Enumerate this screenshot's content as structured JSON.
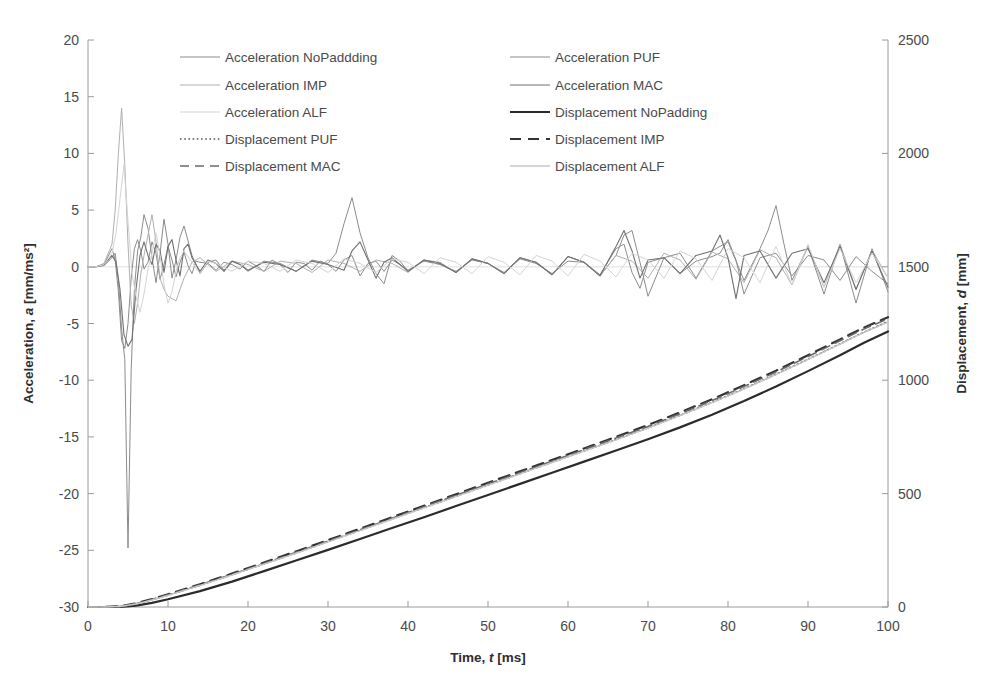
{
  "chart_data": {
    "type": "line",
    "title": "",
    "xlabel_parts": {
      "pre": "Time, ",
      "sym": "t",
      "post": " [ms]"
    },
    "ylabel_left_parts": {
      "pre": "Acceleration, ",
      "sym": "a",
      "post": " [mm/ms²]"
    },
    "ylabel_right_parts": {
      "pre": "Displacement, ",
      "sym": "d",
      "post": " [mm]"
    },
    "xlabel": "Time, t [ms]",
    "ylabel": "Acceleration, a [mm/ms²]",
    "ylabel_right": "Displacement, d [mm]",
    "xlim": [
      0,
      100
    ],
    "ylim": [
      -30,
      20
    ],
    "ylim_right": [
      0,
      2500
    ],
    "xticks": [
      0,
      10,
      20,
      30,
      40,
      50,
      60,
      70,
      80,
      90,
      100
    ],
    "yticks_left": [
      20,
      15,
      10,
      5,
      0,
      -5,
      -10,
      -15,
      -20,
      -25,
      -30
    ],
    "yticks_right": [
      2500,
      2000,
      1500,
      1000,
      500,
      0
    ],
    "grid": false,
    "legend_position": "top-inside",
    "legend_columns": 2,
    "series": [
      {
        "name": "Acceleration NoPaddding",
        "axis": "left",
        "color": "#8c8c8c",
        "width": 1.0,
        "dash": "none",
        "legend_col": 0,
        "legend_row": 0,
        "x": [
          0,
          1,
          2,
          3,
          3.4,
          3.8,
          4.2,
          4.6,
          5,
          5.4,
          5.8,
          6.2,
          6.6,
          7,
          7.5,
          8,
          8.5,
          9,
          9.5,
          10,
          10.5,
          11,
          11.5,
          12,
          12.5,
          13,
          13.5,
          14,
          15,
          16,
          17,
          18,
          19,
          20,
          21,
          22,
          23,
          24,
          25,
          26,
          27,
          28,
          29,
          30,
          31,
          32,
          33,
          34,
          35,
          36,
          37,
          38,
          39,
          40,
          42,
          44,
          46,
          48,
          50,
          52,
          54,
          56,
          58,
          60,
          62,
          64,
          66,
          67,
          68,
          69,
          70,
          72,
          74,
          76,
          78,
          79,
          80,
          81,
          82,
          84,
          86,
          88,
          90,
          92,
          94,
          96,
          98,
          100
        ],
        "y": [
          0,
          0,
          0.2,
          1.6,
          0.6,
          -2.2,
          -6.5,
          -7.2,
          -5.0,
          -1.0,
          1.6,
          2.4,
          1.4,
          -0.2,
          0.4,
          2.2,
          1.2,
          -1.1,
          0.2,
          1.8,
          0.6,
          -0.9,
          0.4,
          1.3,
          0.1,
          -0.6,
          0.5,
          0.4,
          0.3,
          -0.3,
          0.4,
          0.2,
          -0.2,
          0.5,
          0.1,
          -0.4,
          0.6,
          0.2,
          -0.5,
          0.4,
          0.3,
          -0.3,
          0.5,
          0.2,
          -0.4,
          0.6,
          1.0,
          -0.8,
          0.3,
          0.5,
          -0.4,
          0.6,
          0.2,
          -0.3,
          0.5,
          0.2,
          -0.4,
          0.6,
          0.3,
          -0.5,
          0.7,
          0.3,
          -0.6,
          0.5,
          0.4,
          -0.7,
          1.6,
          2.0,
          -0.5,
          -1.9,
          0.4,
          0.8,
          -0.6,
          0.5,
          0.9,
          1.2,
          2.4,
          0.6,
          -2.4,
          0.8,
          1.2,
          -0.8,
          1.0,
          0.6,
          -1.2,
          0.9,
          -0.4,
          -1.5
        ]
      },
      {
        "name": "Acceleration PUF",
        "axis": "left",
        "color": "#8c8c8c",
        "width": 1.0,
        "dash": "none",
        "legend_col": 1,
        "legend_row": 0,
        "x": [
          0,
          1,
          2,
          3,
          3.4,
          3.8,
          4.2,
          4.6,
          5,
          5.4,
          5.8,
          6.2,
          6.6,
          7,
          7.5,
          8,
          8.5,
          9,
          9.5,
          10,
          10.5,
          11,
          11.5,
          12,
          13,
          14,
          15,
          16,
          17,
          18,
          19,
          20,
          22,
          24,
          26,
          28,
          30,
          31,
          32,
          33,
          34,
          35,
          36,
          37,
          38,
          39,
          40,
          42,
          44,
          46,
          48,
          50,
          52,
          54,
          56,
          58,
          60,
          62,
          64,
          66,
          67,
          68,
          69,
          70,
          72,
          74,
          76,
          78,
          80,
          82,
          84,
          85,
          86,
          87,
          88,
          90,
          92,
          94,
          96,
          98,
          100
        ],
        "y": [
          0,
          0,
          0.1,
          0.8,
          1.2,
          -1.2,
          -5.5,
          -8.2,
          -24.8,
          -9.0,
          -2.0,
          1.4,
          2.6,
          4.6,
          3.4,
          0.8,
          -1.4,
          1.2,
          4.2,
          2.0,
          -1.0,
          0.6,
          2.6,
          3.6,
          1.0,
          -0.6,
          0.4,
          0.6,
          -0.3,
          0.5,
          0.2,
          -0.4,
          0.5,
          0.3,
          -0.4,
          0.6,
          0.3,
          1.2,
          3.8,
          6.1,
          3.0,
          0.8,
          -0.6,
          -1.5,
          1.0,
          0.5,
          -0.4,
          0.6,
          0.3,
          -0.5,
          0.7,
          0.3,
          -0.6,
          0.8,
          0.4,
          -0.7,
          0.9,
          0.4,
          -0.8,
          1.0,
          2.8,
          3.2,
          0.4,
          -2.6,
          0.8,
          1.2,
          -1.0,
          1.4,
          2.2,
          -1.2,
          1.6,
          3.2,
          5.4,
          2.0,
          -1.2,
          1.8,
          -2.4,
          2.0,
          -3.2,
          1.6,
          -2.2
        ]
      },
      {
        "name": "Acceleration IMP",
        "axis": "left",
        "color": "#b0b0b0",
        "width": 1.0,
        "dash": "none",
        "legend_col": 0,
        "legend_row": 1,
        "x": [
          0,
          1,
          2,
          3,
          3.4,
          3.8,
          4.2,
          4.6,
          5,
          5.4,
          5.8,
          6.2,
          6.6,
          7,
          7.5,
          8,
          8.5,
          9,
          9.5,
          10,
          11,
          12,
          13,
          14,
          15,
          16,
          18,
          20,
          22,
          24,
          26,
          28,
          30,
          32,
          34,
          36,
          38,
          40,
          42,
          44,
          46,
          48,
          50,
          52,
          54,
          56,
          58,
          60,
          62,
          64,
          66,
          68,
          70,
          72,
          74,
          76,
          78,
          80,
          82,
          84,
          86,
          88,
          90,
          92,
          94,
          96,
          98,
          100
        ],
        "y": [
          0,
          0,
          0.3,
          2.0,
          5.0,
          10.0,
          14.0,
          9.0,
          2.0,
          -3.4,
          -5.0,
          -3.2,
          -0.6,
          1.0,
          2.8,
          4.6,
          2.2,
          -1.0,
          -2.0,
          -2.6,
          -3.0,
          -1.0,
          0.4,
          0.8,
          0.2,
          -0.4,
          0.5,
          0.2,
          -0.4,
          0.5,
          0.3,
          -0.5,
          0.6,
          0.3,
          -0.4,
          0.6,
          0.3,
          -0.5,
          0.6,
          0.4,
          -0.5,
          0.7,
          0.3,
          -0.6,
          0.8,
          0.4,
          -0.7,
          0.9,
          0.4,
          -0.8,
          1.0,
          0.5,
          -1.0,
          1.2,
          0.6,
          -1.1,
          1.3,
          0.7,
          -1.4,
          1.5,
          0.8,
          -1.6,
          1.8,
          -1.8,
          2.0,
          -2.0,
          1.5,
          -1.0
        ]
      },
      {
        "name": "Acceleration MAC",
        "axis": "left",
        "color": "#707070",
        "width": 1.1,
        "dash": "none",
        "legend_col": 1,
        "legend_row": 1,
        "x": [
          0,
          1,
          2,
          3,
          3.5,
          4,
          4.5,
          5,
          5.5,
          6,
          6.5,
          7,
          7.5,
          8,
          8.5,
          9,
          9.5,
          10,
          10.5,
          11,
          11.5,
          12,
          12.5,
          13,
          14,
          15,
          16,
          17,
          18,
          19,
          20,
          22,
          24,
          26,
          28,
          30,
          32,
          33,
          34,
          35,
          36,
          37,
          38,
          40,
          42,
          44,
          46,
          48,
          50,
          52,
          54,
          56,
          58,
          60,
          62,
          64,
          66,
          67,
          68,
          69,
          70,
          72,
          74,
          76,
          78,
          79,
          80,
          81,
          82,
          84,
          86,
          88,
          90,
          92,
          94,
          96,
          98,
          100
        ],
        "y": [
          0,
          0,
          0.2,
          1.0,
          0.4,
          -2.0,
          -6.0,
          -7.0,
          -6.4,
          -2.0,
          1.0,
          2.2,
          1.0,
          0.2,
          2.0,
          1.4,
          -0.5,
          1.8,
          2.4,
          0.6,
          -0.8,
          1.6,
          2.0,
          0.8,
          -0.4,
          0.6,
          0.3,
          -0.4,
          0.5,
          0.2,
          -0.3,
          0.4,
          0.2,
          -0.4,
          0.5,
          0.2,
          -0.3,
          1.4,
          2.2,
          0.6,
          -1.0,
          0.4,
          0.8,
          -0.4,
          0.6,
          0.3,
          -0.5,
          0.7,
          0.3,
          -0.6,
          0.8,
          0.4,
          -0.7,
          0.9,
          0.4,
          -0.8,
          1.8,
          3.2,
          1.4,
          -1.0,
          0.6,
          0.8,
          -0.6,
          1.0,
          1.4,
          2.8,
          0.8,
          -2.8,
          1.0,
          1.4,
          -1.0,
          1.2,
          1.6,
          -1.4,
          1.8,
          -2.0,
          1.4,
          -1.8
        ]
      },
      {
        "name": "Acceleration ALF",
        "axis": "left",
        "color": "#d4d4d4",
        "width": 1.0,
        "dash": "none",
        "legend_col": 0,
        "legend_row": 2,
        "x": [
          0,
          1,
          2,
          3,
          3.5,
          4,
          4.5,
          5,
          5.5,
          6,
          6.5,
          7,
          7.5,
          8,
          8.5,
          9,
          9.5,
          10,
          10.5,
          11,
          11.5,
          12,
          13,
          14,
          15,
          16,
          18,
          20,
          22,
          24,
          26,
          28,
          30,
          32,
          34,
          36,
          38,
          40,
          42,
          44,
          46,
          48,
          50,
          52,
          54,
          56,
          58,
          60,
          62,
          64,
          66,
          68,
          70,
          72,
          74,
          76,
          78,
          80,
          82,
          84,
          86,
          88,
          90,
          92,
          94,
          96,
          98,
          100
        ],
        "y": [
          0,
          0,
          0.2,
          1.2,
          3.0,
          6.0,
          9.0,
          4.0,
          -0.6,
          -2.6,
          -4.0,
          -2.4,
          -0.2,
          1.2,
          3.0,
          1.0,
          -1.6,
          -3.2,
          -2.2,
          -0.4,
          0.8,
          1.4,
          0.4,
          -0.6,
          0.5,
          0.3,
          -0.4,
          0.5,
          0.3,
          -0.4,
          0.6,
          0.3,
          -0.5,
          0.7,
          0.3,
          -0.5,
          0.7,
          0.4,
          -0.6,
          0.8,
          0.4,
          -0.6,
          0.9,
          0.4,
          -0.7,
          1.0,
          0.5,
          -0.8,
          1.1,
          0.5,
          -0.9,
          1.2,
          0.6,
          -1.0,
          1.4,
          0.7,
          -1.2,
          1.6,
          0.8,
          -1.4,
          1.8,
          -1.6,
          2.0,
          -1.8,
          1.6,
          -1.4,
          1.2,
          -1.0
        ]
      },
      {
        "name": "Displacement NoPadding",
        "axis": "right",
        "color": "#2b2b2b",
        "width": 2.2,
        "dash": "none",
        "legend_col": 1,
        "legend_row": 2,
        "x": [
          0,
          2,
          4,
          6,
          8,
          10,
          14,
          18,
          22,
          26,
          30,
          34,
          38,
          42,
          46,
          50,
          54,
          58,
          62,
          66,
          70,
          74,
          78,
          82,
          86,
          90,
          94,
          97,
          100
        ],
        "y": [
          0,
          0,
          0,
          6,
          18,
          34,
          70,
          112,
          158,
          205,
          252,
          300,
          348,
          396,
          445,
          494,
          543,
          592,
          641,
          690,
          740,
          792,
          848,
          908,
          972,
          1040,
          1110,
          1165,
          1215
        ]
      },
      {
        "name": "Displacement PUF",
        "axis": "right",
        "color": "#555555",
        "width": 1.6,
        "dash": "dotted",
        "legend_col": 0,
        "legend_row": 3,
        "x": [
          0,
          2,
          4,
          6,
          8,
          10,
          14,
          18,
          22,
          26,
          30,
          34,
          38,
          42,
          46,
          50,
          54,
          58,
          62,
          66,
          70,
          74,
          78,
          82,
          86,
          90,
          94,
          97,
          100
        ],
        "y": [
          0,
          0,
          2,
          14,
          32,
          52,
          96,
          142,
          190,
          238,
          288,
          338,
          388,
          438,
          488,
          538,
          588,
          638,
          688,
          738,
          790,
          845,
          902,
          962,
          1026,
          1092,
          1160,
          1212,
          1258
        ]
      },
      {
        "name": "Displacement IMP",
        "axis": "right",
        "color": "#333333",
        "width": 2.2,
        "dash": "dashed",
        "legend_col": 1,
        "legend_row": 3,
        "x": [
          0,
          2,
          4,
          6,
          8,
          10,
          14,
          18,
          22,
          26,
          30,
          34,
          38,
          42,
          46,
          50,
          54,
          58,
          62,
          66,
          70,
          74,
          78,
          82,
          86,
          90,
          94,
          97,
          100
        ],
        "y": [
          0,
          0,
          3,
          16,
          35,
          56,
          100,
          147,
          196,
          245,
          295,
          345,
          396,
          446,
          497,
          548,
          598,
          648,
          699,
          750,
          802,
          858,
          916,
          978,
          1042,
          1110,
          1180,
          1232,
          1278
        ]
      },
      {
        "name": "Displacement MAC",
        "axis": "right",
        "color": "#6a6a6a",
        "width": 1.6,
        "dash": "dashed",
        "legend_col": 0,
        "legend_row": 4,
        "x": [
          0,
          2,
          4,
          6,
          8,
          10,
          14,
          18,
          22,
          26,
          30,
          34,
          38,
          42,
          46,
          50,
          54,
          58,
          62,
          66,
          70,
          74,
          78,
          82,
          86,
          90,
          94,
          97,
          100
        ],
        "y": [
          0,
          0,
          2,
          14,
          33,
          54,
          98,
          144,
          192,
          241,
          291,
          341,
          391,
          442,
          493,
          543,
          593,
          643,
          694,
          745,
          796,
          852,
          910,
          972,
          1036,
          1104,
          1174,
          1226,
          1270
        ]
      },
      {
        "name": "Displacement ALF",
        "axis": "right",
        "color": "#c8c8c8",
        "width": 1.4,
        "dash": "none",
        "legend_col": 1,
        "legend_row": 4,
        "x": [
          0,
          2,
          4,
          6,
          8,
          10,
          14,
          18,
          22,
          26,
          30,
          34,
          38,
          42,
          46,
          50,
          54,
          58,
          62,
          66,
          70,
          74,
          78,
          82,
          86,
          90,
          94,
          97,
          100
        ],
        "y": [
          0,
          0,
          2,
          13,
          31,
          51,
          95,
          141,
          189,
          237,
          287,
          337,
          387,
          437,
          487,
          537,
          587,
          637,
          687,
          737,
          789,
          844,
          901,
          961,
          1025,
          1091,
          1159,
          1211,
          1256
        ]
      }
    ]
  },
  "legend": {
    "entries": [
      {
        "label": "Acceleration NoPaddding",
        "col": 0,
        "row": 0
      },
      {
        "label": "Acceleration PUF",
        "col": 1,
        "row": 0
      },
      {
        "label": "Acceleration IMP",
        "col": 0,
        "row": 1
      },
      {
        "label": "Acceleration MAC",
        "col": 1,
        "row": 1
      },
      {
        "label": "Acceleration ALF",
        "col": 0,
        "row": 2
      },
      {
        "label": "Displacement NoPadding",
        "col": 1,
        "row": 2
      },
      {
        "label": "Displacement PUF",
        "col": 0,
        "row": 3
      },
      {
        "label": "Displacement IMP",
        "col": 1,
        "row": 3
      },
      {
        "label": "Displacement MAC",
        "col": 0,
        "row": 4
      },
      {
        "label": "Displacement ALF",
        "col": 1,
        "row": 4
      }
    ]
  }
}
